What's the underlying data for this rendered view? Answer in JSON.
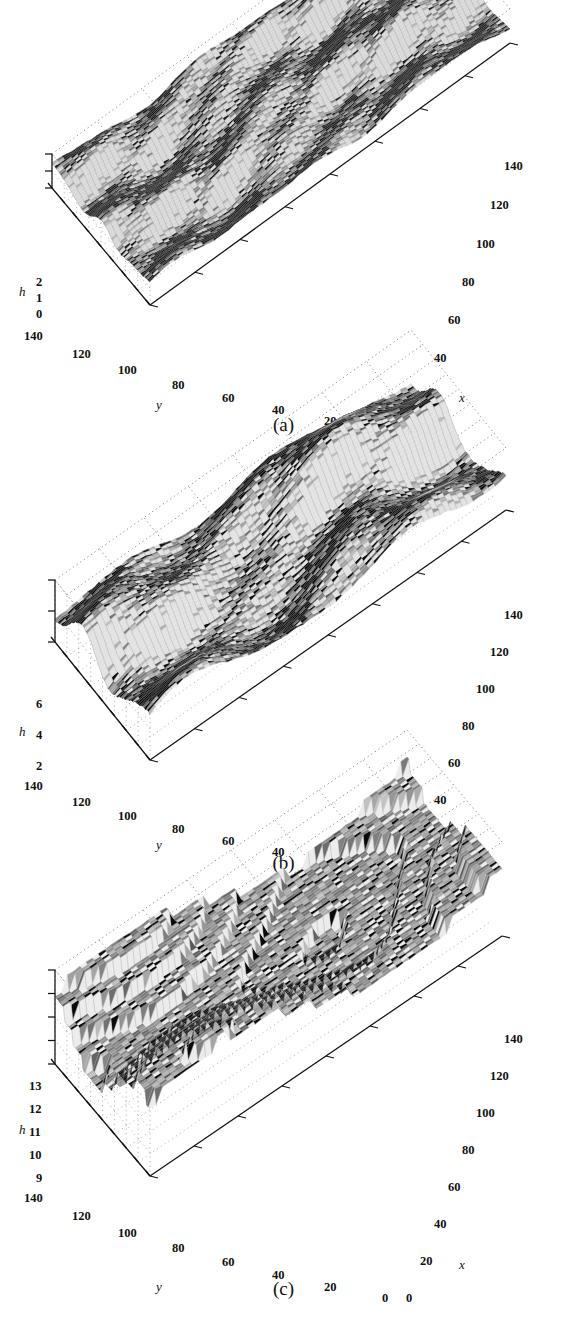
{
  "figure": {
    "type": "3d-surface-triptych",
    "background": "#ffffff",
    "ink": "#111111"
  },
  "panels": [
    {
      "id": "a",
      "caption": "(a)",
      "h_axis": {
        "label": "h",
        "ticks": [
          "0",
          "1",
          "2"
        ],
        "values": [
          0,
          1,
          2
        ],
        "range": [
          0,
          2
        ]
      },
      "y_axis": {
        "label": "y",
        "ticks": [
          "140",
          "120",
          "100",
          "80",
          "60",
          "40",
          "20",
          "0"
        ],
        "values": [
          140,
          120,
          100,
          80,
          60,
          40,
          20,
          0
        ],
        "range": [
          0,
          140
        ]
      },
      "x_axis": {
        "label": "x",
        "ticks": [
          "0",
          "20",
          "40",
          "60",
          "80",
          "100",
          "120",
          "140"
        ],
        "values": [
          0,
          20,
          40,
          60,
          80,
          100,
          120,
          140
        ],
        "range": [
          0,
          140
        ]
      },
      "surface": {
        "description": "rough mesh surface, low amplitude, many short dark ridges",
        "mean_height": 1.0,
        "roughness": "high-frequency",
        "ridge_count": 22,
        "ridge_length": "short",
        "step_contrast": "low"
      }
    },
    {
      "id": "b",
      "caption": "(b)",
      "h_axis": {
        "label": "h",
        "ticks": [
          "2",
          "4",
          "6"
        ],
        "values": [
          2,
          4,
          6
        ],
        "range": [
          2,
          6
        ]
      },
      "y_axis": {
        "label": "y",
        "ticks": [
          "140",
          "120",
          "100",
          "80",
          "60",
          "40",
          "20",
          "0"
        ],
        "values": [
          140,
          120,
          100,
          80,
          60,
          40,
          20,
          0
        ],
        "range": [
          0,
          140
        ]
      },
      "x_axis": {
        "label": "x",
        "ticks": [
          "0",
          "20",
          "40",
          "60",
          "80",
          "100",
          "120",
          "140"
        ],
        "values": [
          0,
          20,
          40,
          60,
          80,
          100,
          120,
          140
        ],
        "range": [
          0,
          140
        ]
      },
      "surface": {
        "description": "coarser mesh surface with pronounced black terrace steps",
        "mean_height": 4.0,
        "roughness": "medium-frequency",
        "ridge_count": 16,
        "ridge_length": "long",
        "step_contrast": "high"
      }
    },
    {
      "id": "c",
      "caption": "(c)",
      "h_axis": {
        "label": "h",
        "ticks": [
          "9",
          "10",
          "11",
          "12",
          "13"
        ],
        "values": [
          9,
          10,
          11,
          12,
          13
        ],
        "range": [
          9,
          13
        ]
      },
      "y_axis": {
        "label": "y",
        "ticks": [
          "140",
          "120",
          "100",
          "80",
          "60",
          "40",
          "20",
          "0"
        ],
        "values": [
          140,
          120,
          100,
          80,
          60,
          40,
          20,
          0
        ],
        "range": [
          0,
          140
        ]
      },
      "x_axis": {
        "label": "x",
        "ticks": [
          "0",
          "20",
          "40",
          "60",
          "80",
          "100",
          "120",
          "140"
        ],
        "values": [
          0,
          20,
          40,
          60,
          80,
          100,
          120,
          140
        ],
        "range": [
          0,
          140
        ]
      },
      "surface": {
        "description": "broad flat plateaus separated by sharp wide terrace edges",
        "mean_height": 11.0,
        "roughness": "low-frequency",
        "ridge_count": 9,
        "ridge_length": "very-long",
        "step_contrast": "very-high"
      }
    }
  ],
  "chart_data": {
    "type": "surface",
    "title": "",
    "xlabel": "x",
    "ylabel": "y",
    "zlabel": "h",
    "grid": true,
    "legend": "none",
    "projection": "3d",
    "panels": [
      {
        "name": "(a)",
        "xlim": [
          0,
          140
        ],
        "ylim": [
          0,
          140
        ],
        "zlim": [
          0,
          2
        ],
        "zticks": [
          0,
          1,
          2
        ],
        "xticks": [
          0,
          20,
          40,
          60,
          80,
          100,
          120,
          140
        ],
        "yticks": [
          0,
          20,
          40,
          60,
          80,
          100,
          120,
          140
        ],
        "mean_z": 1.0,
        "z_span": 2
      },
      {
        "name": "(b)",
        "xlim": [
          0,
          140
        ],
        "ylim": [
          0,
          140
        ],
        "zlim": [
          2,
          6
        ],
        "zticks": [
          2,
          4,
          6
        ],
        "xticks": [
          0,
          20,
          40,
          60,
          80,
          100,
          120,
          140
        ],
        "yticks": [
          0,
          20,
          40,
          60,
          80,
          100,
          120,
          140
        ],
        "mean_z": 4.0,
        "z_span": 4
      },
      {
        "name": "(c)",
        "xlim": [
          0,
          140
        ],
        "ylim": [
          0,
          140
        ],
        "zlim": [
          9,
          13
        ],
        "zticks": [
          9,
          10,
          11,
          12,
          13
        ],
        "xticks": [
          0,
          20,
          40,
          60,
          80,
          100,
          120,
          140
        ],
        "yticks": [
          0,
          20,
          40,
          60,
          80,
          100,
          120,
          140
        ],
        "mean_z": 11.0,
        "z_span": 4
      }
    ]
  }
}
